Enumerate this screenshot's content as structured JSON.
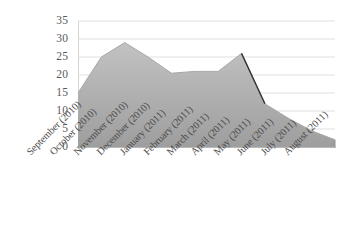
{
  "chart_data": {
    "type": "area",
    "title": "",
    "subtitle": "",
    "xlabel": "",
    "ylabel": "",
    "categories": [
      "September (2010)",
      "October (2010)",
      "November (2010)",
      "December (2010)",
      "January (2011)",
      "February (2011)",
      "March (2011)",
      "April (2011)",
      "May (2011)",
      "June (2011)",
      "July (2011)",
      "August (2011)"
    ],
    "values": [
      15,
      25,
      29,
      25,
      20.5,
      21,
      21,
      26,
      12,
      8,
      4.5,
      2
    ],
    "ylim": [
      0,
      35
    ],
    "yticks": [
      0,
      5,
      10,
      15,
      20,
      25,
      30,
      35
    ],
    "ytick_labels": [
      "0",
      "5",
      "10",
      "15",
      "20",
      "25",
      "30",
      "35"
    ],
    "grid": true,
    "grid_axis": "y",
    "legend": false,
    "legend_position": "none",
    "series": [
      {
        "name": "series-1",
        "values": [
          15,
          25,
          29,
          25,
          20.5,
          21,
          21,
          26,
          12,
          8,
          4.5,
          2
        ],
        "fill_color": "#b3b3b3",
        "line_color": "#333333"
      }
    ],
    "colors": {
      "area_fill": "#b3b3b3",
      "line": "#333333",
      "gridline": "#e0e0e0",
      "axis": "#b8b8b8",
      "tick_text": "#595959",
      "category_text": "#4a4a4a",
      "background": "#ffffff"
    },
    "annotations": [
      {
        "name": "april-to-may-drop",
        "from_category": "April (2011)",
        "to_category": "May (2011)",
        "from_value": 26,
        "to_value": 12
      }
    ]
  }
}
